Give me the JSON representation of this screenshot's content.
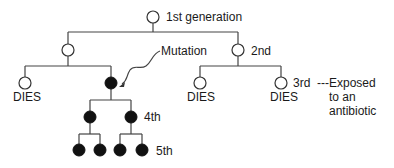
{
  "diagram": {
    "labels": {
      "gen1": "1st generation",
      "gen2": "2nd",
      "gen3": "3rd",
      "gen4": "4th",
      "gen5": "5th",
      "mutation": "Mutation",
      "dies_1": "DIES",
      "dies_2": "DIES",
      "dies_3": "DIES",
      "exposed_line1": "Exposed",
      "exposed_line2": "to an",
      "exposed_line3": "antibiotic",
      "dashes": "---"
    },
    "legend": {
      "open_circle": "non-resistant bacterium",
      "filled_circle": "mutated (resistant) bacterium"
    },
    "colors": {
      "line": "#444444",
      "filled": "#111111",
      "open_fill": "#ffffff"
    }
  }
}
